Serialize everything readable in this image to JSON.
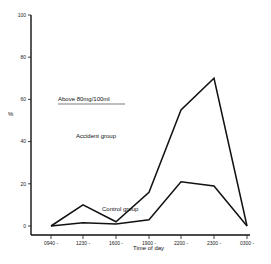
{
  "chart_data": {
    "type": "line",
    "title": "",
    "annotation": "Above  80mg/100ml",
    "xlabel": "Time  of  day",
    "ylabel": "%",
    "ylim": [
      0,
      100
    ],
    "yticks": [
      0,
      20,
      40,
      60,
      80,
      100
    ],
    "categories": [
      "0940 -",
      "1230 -",
      "1600 -",
      "1900 -",
      "2200 -",
      "2300 -",
      "0300 -"
    ],
    "series": [
      {
        "name": "Accident  group",
        "values": [
          0,
          10,
          2,
          16,
          55,
          70,
          0
        ]
      },
      {
        "name": "Control  group",
        "values": [
          0,
          1.5,
          1,
          3,
          21,
          19,
          0
        ]
      }
    ],
    "grid": false,
    "legend_position": "inline labels"
  }
}
